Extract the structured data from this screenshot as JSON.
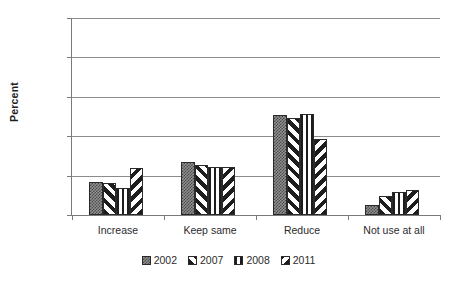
{
  "chart_data": {
    "type": "bar",
    "title": "",
    "subtitle": "",
    "xlabel": "",
    "ylabel": "Percent",
    "ylim": [
      0,
      100
    ],
    "yticks": [
      0,
      20,
      40,
      60,
      80,
      100
    ],
    "ytick_labels": [
      "0",
      "20",
      "40",
      "60",
      "80",
      "100"
    ],
    "grid": true,
    "legend_position": "bottom",
    "categories": [
      "Increase",
      "Keep same",
      "Reduce",
      "Not use at all"
    ],
    "series": [
      {
        "name": "2002",
        "pattern": "dotted-grey",
        "values": [
          17,
          27,
          51,
          5
        ]
      },
      {
        "name": "2007",
        "pattern": "diagonal-forward",
        "values": [
          16,
          25.5,
          49,
          9.5
        ]
      },
      {
        "name": "2008",
        "pattern": "vertical-lines",
        "values": [
          13.5,
          24.5,
          51.5,
          11.5
        ]
      },
      {
        "name": "2011",
        "pattern": "diagonal-backward",
        "values": [
          24,
          24.5,
          38.5,
          12.5
        ]
      }
    ],
    "colors": {
      "series_2002": "#8f8f8f",
      "series_2007": "#1d1d1d",
      "series_2008": "#1d1d1d",
      "series_2011": "#1d1d1d",
      "gridline": "#8c8c8c",
      "axis": "#7a7a7a",
      "text": "#2b2b2b",
      "background": "#ffffff"
    }
  }
}
